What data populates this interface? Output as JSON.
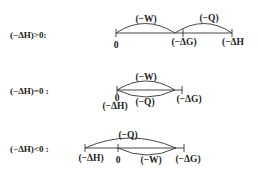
{
  "rows": [
    {
      "condition": "(−ΔH)>0:",
      "labels": {
        "zero": "0",
        "neg_dG": "(−ΔG)",
        "neg_dH": "(−ΔH",
        "neg_W": "(−W)",
        "neg_Q": "(−Q)"
      }
    },
    {
      "condition": "(−ΔH)=0 :",
      "labels": {
        "zero": "0",
        "neg_dH": "(−ΔH)",
        "neg_dG": "(−ΔG)",
        "neg_W": "(−W)",
        "neg_Q": "(−Q)"
      }
    },
    {
      "condition": "(−ΔH)<0 :",
      "labels": {
        "neg_dH": "(−ΔH)",
        "zero": "0",
        "neg_W": "(−W)",
        "neg_dG": "(−ΔG)",
        "neg_Q": "(−Q)"
      }
    }
  ]
}
